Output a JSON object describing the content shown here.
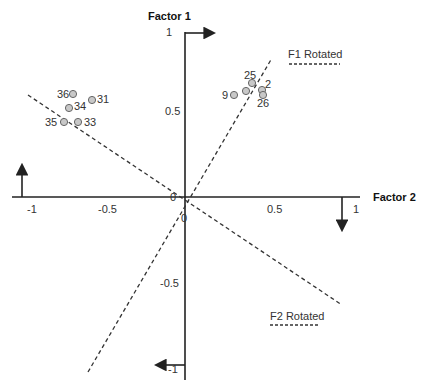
{
  "diagram": {
    "axes": {
      "vertical": {
        "title": "Factor 1",
        "ticks": [
          {
            "label": "1",
            "value": 1
          },
          {
            "label": "0.5",
            "value": 0.5
          },
          {
            "label": "0",
            "value": 0
          },
          {
            "label": "-0.5",
            "value": -0.5
          },
          {
            "label": "-1",
            "value": -1
          }
        ]
      },
      "horizontal": {
        "title": "Factor 2",
        "ticks": [
          {
            "label": "-1",
            "value": -1
          },
          {
            "label": "-0.5",
            "value": -0.5
          },
          {
            "label": "0",
            "value": 0
          },
          {
            "label": "0.5",
            "value": 0.5
          },
          {
            "label": "1",
            "value": 1
          }
        ]
      }
    },
    "rotated_axes": [
      {
        "label": "F1 Rotated",
        "style": "dashed"
      },
      {
        "label": "F2 Rotated",
        "style": "dashed"
      }
    ],
    "points": [
      {
        "label": "25",
        "x": 0.4,
        "y": 0.67
      },
      {
        "label": "2",
        "x": 0.47,
        "y": 0.64
      },
      {
        "label": "26",
        "x": 0.47,
        "y": 0.6
      },
      {
        "label": "9",
        "x": 0.3,
        "y": 0.6
      },
      {
        "label": "",
        "x": 0.37,
        "y": 0.62
      },
      {
        "label": "36",
        "x": -0.8,
        "y": 0.62
      },
      {
        "label": "31",
        "x": -0.63,
        "y": 0.58
      },
      {
        "label": "34",
        "x": -0.75,
        "y": 0.54
      },
      {
        "label": "35",
        "x": -0.82,
        "y": 0.44
      },
      {
        "label": "33",
        "x": -0.72,
        "y": 0.44
      }
    ],
    "colors": {
      "axis": "#222222",
      "point_fill": "#c8c8c8",
      "point_stroke": "#666666",
      "dashed": "#333333"
    }
  }
}
